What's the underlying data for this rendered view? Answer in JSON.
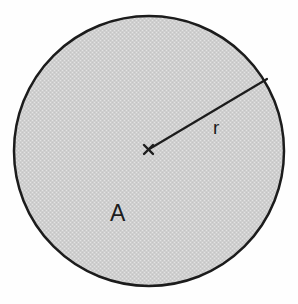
{
  "figure": {
    "width": 298,
    "height": 304,
    "background_color": "#fefefe"
  },
  "labels": {
    "radius_label": "r",
    "area_label": "A",
    "center_marker": "×"
  },
  "colors": {
    "stroke": "#1c1c1c",
    "fill": "#cccccc",
    "fill_dither_light": "#e0e0e0",
    "label_color": "#1c1c1c",
    "background": "#fefefe"
  },
  "chart_data": {
    "type": "diagram",
    "shapes": [
      {
        "name": "circle",
        "type": "circle",
        "cx": 149,
        "cy": 151,
        "r": 135,
        "fill": "#cccccc",
        "stroke": "#1c1c1c",
        "stroke_width": 2.5
      },
      {
        "name": "radius-line",
        "type": "line",
        "x1": 148.5,
        "y1": 149.5,
        "x2": 267,
        "y2": 79,
        "stroke": "#1c1c1c",
        "stroke_width": 2.2,
        "angle_deg": -30.8
      },
      {
        "name": "center-marker",
        "type": "cross",
        "cx": 148.5,
        "cy": 149.5,
        "size": 9,
        "stroke": "#1c1c1c",
        "stroke_width": 2.4
      }
    ],
    "annotations": [
      {
        "name": "radius-label",
        "text": "r",
        "x": 213,
        "y": 134,
        "font_size": 19
      },
      {
        "name": "area-label",
        "text": "A",
        "x": 110,
        "y": 221,
        "font_size": 23
      }
    ]
  }
}
